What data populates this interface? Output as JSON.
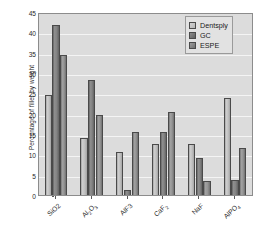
{
  "chart_data": {
    "type": "bar",
    "title": "",
    "xlabel": "",
    "ylabel": "Percentage of filler by weight",
    "ylim": [
      0,
      45
    ],
    "ytick_step": 5,
    "yticks": [
      0,
      5,
      10,
      15,
      20,
      25,
      30,
      35,
      40,
      45
    ],
    "grid": true,
    "legend_position": "top-right",
    "categories": [
      "SiO2",
      "Al2O3",
      "AlF3",
      "CaF2",
      "NaF",
      "AlPO4"
    ],
    "category_labels_html": [
      "SiO2",
      "Al<sub>2</sub>O<sub>3</sub>",
      "AlF3",
      "CaF<sub>2</sub>",
      "NaF",
      "AlPO<sub>4</sub>"
    ],
    "series": [
      {
        "name": "Dentsply",
        "color": "#c2c2c2",
        "values": [
          24.5,
          14.0,
          10.7,
          12.5,
          12.6,
          23.9
        ]
      },
      {
        "name": "GC",
        "color": "#7d7d7d",
        "values": [
          41.8,
          28.3,
          1.2,
          15.6,
          9.0,
          3.6
        ]
      },
      {
        "name": "ESPE",
        "color": "#909090",
        "values": [
          34.5,
          19.7,
          15.4,
          20.5,
          3.4,
          11.6
        ]
      }
    ]
  },
  "legend": {
    "items": [
      {
        "label": "Dentsply"
      },
      {
        "label": "GC"
      },
      {
        "label": "ESPE"
      }
    ]
  },
  "axes": {
    "y_title": "Percentage of filler by weight"
  }
}
